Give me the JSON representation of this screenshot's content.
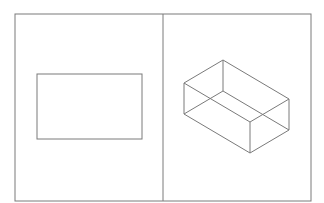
{
  "figure": {
    "stroke_color": "#7a7a7a",
    "background": "#ffffff",
    "frame": {
      "x": 15,
      "y": 14,
      "width": 296,
      "height": 187
    },
    "divider_x": 163,
    "left_panel": {
      "label": "Front view",
      "rectangle": {
        "x": 37,
        "y": 74,
        "width": 105,
        "height": 65
      }
    },
    "right_panel": {
      "label": "Isometric view",
      "box_vertices": {
        "top_back": [
          223,
          60
        ],
        "top_left": [
          184,
          83
        ],
        "top_right": [
          289,
          99
        ],
        "top_front": [
          250,
          122
        ],
        "bottom_back": [
          223,
          91
        ],
        "bottom_left": [
          184,
          114
        ],
        "bottom_right": [
          289,
          130
        ],
        "bottom_front": [
          250,
          153
        ]
      }
    }
  }
}
